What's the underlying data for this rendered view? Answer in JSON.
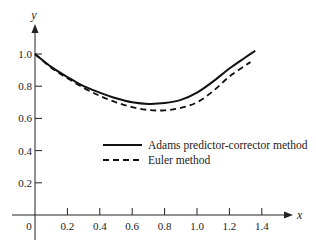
{
  "chart_data": {
    "type": "line",
    "title": "",
    "xlabel": "x",
    "ylabel": "y",
    "xlim": [
      0,
      1.4
    ],
    "ylim": [
      0,
      1.0
    ],
    "grid": false,
    "legend_position": "center-right",
    "x_ticks": [
      {
        "value": 0,
        "label": "0"
      },
      {
        "value": 0.2,
        "label": "0.2"
      },
      {
        "value": 0.4,
        "label": "0.4"
      },
      {
        "value": 0.6,
        "label": "0.6"
      },
      {
        "value": 0.8,
        "label": "0.8"
      },
      {
        "value": 1.0,
        "label": "1.0"
      },
      {
        "value": 1.2,
        "label": "1.2"
      },
      {
        "value": 1.4,
        "label": "1.4"
      }
    ],
    "y_ticks": [
      {
        "value": 0.2,
        "label": "0.2"
      },
      {
        "value": 0.4,
        "label": "0.4"
      },
      {
        "value": 0.6,
        "label": "0.6"
      },
      {
        "value": 0.8,
        "label": "0.8"
      },
      {
        "value": 1.0,
        "label": "1.0"
      }
    ],
    "series": [
      {
        "name": "Adams predictor-corrector method",
        "style": "solid",
        "color": "#111111",
        "x": [
          0,
          0.1,
          0.2,
          0.3,
          0.4,
          0.5,
          0.6,
          0.7,
          0.8,
          0.9,
          1.0,
          1.1,
          1.2,
          1.3,
          1.36
        ],
        "y": [
          1.0,
          0.92,
          0.857,
          0.8,
          0.76,
          0.725,
          0.7,
          0.69,
          0.695,
          0.715,
          0.76,
          0.83,
          0.91,
          0.98,
          1.02
        ]
      },
      {
        "name": "Euler method",
        "style": "dashed",
        "color": "#111111",
        "x": [
          0,
          0.1,
          0.2,
          0.3,
          0.4,
          0.5,
          0.6,
          0.7,
          0.8,
          0.9,
          1.0,
          1.1,
          1.2,
          1.3,
          1.33
        ],
        "y": [
          1.0,
          0.915,
          0.85,
          0.79,
          0.74,
          0.7,
          0.67,
          0.652,
          0.65,
          0.665,
          0.7,
          0.77,
          0.86,
          0.93,
          0.95
        ]
      }
    ]
  }
}
